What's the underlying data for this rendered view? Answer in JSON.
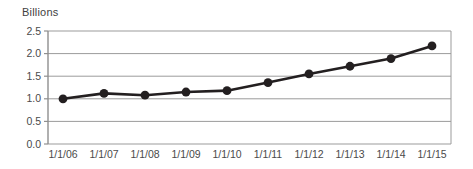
{
  "chart_data": {
    "type": "line",
    "title": "",
    "subtitle": "",
    "ylabel": "Billions",
    "xlabel": "",
    "categories": [
      "1/1/06",
      "1/1/07",
      "1/1/08",
      "1/1/09",
      "1/1/10",
      "1/1/11",
      "1/1/12",
      "1/1/13",
      "1/1/14",
      "1/1/15"
    ],
    "values": [
      1.0,
      1.12,
      1.08,
      1.15,
      1.18,
      1.36,
      1.55,
      1.72,
      1.89,
      2.17
    ],
    "series": [
      {
        "name": "",
        "values": [
          1.0,
          1.12,
          1.08,
          1.15,
          1.18,
          1.36,
          1.55,
          1.72,
          1.89,
          2.17
        ]
      }
    ],
    "ylim": [
      0.0,
      2.5
    ],
    "yticks": [
      0.0,
      0.5,
      1.0,
      1.5,
      2.0,
      2.5
    ],
    "ytick_labels": [
      "0.0",
      "0.5",
      "1.0",
      "1.5",
      "2.0",
      "2.5"
    ],
    "xtick_labels": [
      "1/1/06",
      "1/1/07",
      "1/1/08",
      "1/1/09",
      "1/1/10",
      "1/1/11",
      "1/1/12",
      "1/1/13",
      "1/1/14",
      "1/1/15"
    ],
    "grid": true,
    "grid_axis": "y",
    "legend": false,
    "legend_position": "none",
    "markers": true,
    "marker_shape": "circle",
    "annotations": []
  },
  "style": {
    "line_color": "#231f20",
    "marker_color": "#231f20",
    "grid_color": "#9b9b9b",
    "axis_color": "#8f8f8f",
    "text_color": "#4a4a4a",
    "background": "#ffffff"
  }
}
